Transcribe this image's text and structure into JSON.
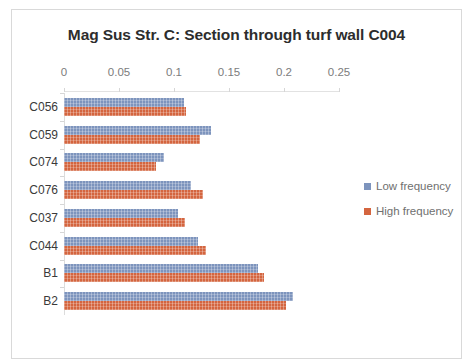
{
  "chart_data": {
    "type": "bar",
    "orientation": "horizontal",
    "title": "Mag Sus Str. C: Section through turf wall C004",
    "xlabel": "",
    "ylabel": "",
    "xlim": [
      0,
      0.25
    ],
    "xticks": [
      "0",
      "0.05",
      "0.1",
      "0.15",
      "0.2",
      "0.25"
    ],
    "xtick_values": [
      0,
      0.05,
      0.1,
      0.15,
      0.2,
      0.25
    ],
    "grid": false,
    "legend_position": "right",
    "categories": [
      "C056",
      "C059",
      "C074",
      "C076",
      "C037",
      "C044",
      "B1",
      "B2"
    ],
    "series": [
      {
        "name": "Low frequency",
        "color": "#7d94bd",
        "values": [
          0.109,
          0.134,
          0.091,
          0.115,
          0.104,
          0.122,
          0.176,
          0.208
        ]
      },
      {
        "name": "High frequency",
        "color": "#d4653f",
        "values": [
          0.111,
          0.124,
          0.084,
          0.126,
          0.11,
          0.129,
          0.182,
          0.202
        ]
      }
    ]
  },
  "frame": {
    "border_color": "#d9d9d9",
    "background": "#ffffff"
  }
}
